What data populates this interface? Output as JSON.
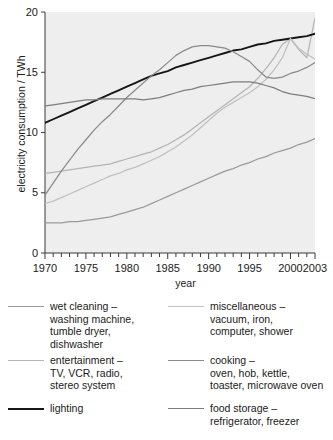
{
  "chart_data": {
    "type": "line",
    "title": "",
    "xlabel": "year",
    "ylabel": "electricity consumption / TWh",
    "xlim": [
      1970,
      2003
    ],
    "ylim": [
      0,
      20
    ],
    "xticks": [
      1970,
      1975,
      1980,
      1985,
      1990,
      1995,
      2000,
      2003
    ],
    "xtick_labels": [
      "1970",
      "1975",
      "1980",
      "1985",
      "1990",
      "1995",
      "2000",
      "2003"
    ],
    "minor_xticks_every": 1,
    "yticks": [
      0,
      5,
      10,
      15,
      20
    ],
    "ytick_labels": [
      "0",
      "5",
      "10",
      "15",
      "20"
    ],
    "grid": false,
    "legend_position": "below",
    "plot_background": "#eeeeee",
    "x": [
      1970,
      1971,
      1972,
      1973,
      1974,
      1975,
      1976,
      1977,
      1978,
      1979,
      1980,
      1981,
      1982,
      1983,
      1984,
      1985,
      1986,
      1987,
      1988,
      1989,
      1990,
      1991,
      1992,
      1993,
      1994,
      1995,
      1996,
      1997,
      1998,
      1999,
      2000,
      2001,
      2002,
      2003
    ],
    "series": [
      {
        "name": "wet cleaning",
        "color": "#9a9a9a",
        "values": [
          2.5,
          2.5,
          2.5,
          2.6,
          2.6,
          2.7,
          2.8,
          2.9,
          3.0,
          3.2,
          3.4,
          3.6,
          3.8,
          4.1,
          4.4,
          4.7,
          5.0,
          5.3,
          5.6,
          5.9,
          6.2,
          6.5,
          6.8,
          7.0,
          7.3,
          7.5,
          7.8,
          8.0,
          8.3,
          8.5,
          8.7,
          9.0,
          9.2,
          9.5
        ]
      },
      {
        "name": "entertainment",
        "color": "#b4b4b4",
        "values": [
          6.6,
          6.7,
          6.8,
          6.9,
          7.0,
          7.1,
          7.2,
          7.3,
          7.4,
          7.6,
          7.8,
          8.0,
          8.2,
          8.4,
          8.7,
          9.0,
          9.4,
          9.8,
          10.3,
          10.8,
          11.3,
          11.8,
          12.3,
          12.8,
          13.3,
          13.8,
          14.5,
          15.3,
          16.2,
          17.3,
          17.8,
          16.9,
          16.2,
          19.5
        ]
      },
      {
        "name": "lighting",
        "color": "#161616",
        "values": [
          10.8,
          11.1,
          11.4,
          11.7,
          12.0,
          12.3,
          12.6,
          12.9,
          13.2,
          13.5,
          13.8,
          14.1,
          14.4,
          14.7,
          14.9,
          15.1,
          15.4,
          15.6,
          15.8,
          16.0,
          16.2,
          16.4,
          16.6,
          16.8,
          16.9,
          17.1,
          17.3,
          17.4,
          17.6,
          17.7,
          17.8,
          17.9,
          18.0,
          18.2
        ]
      },
      {
        "name": "miscellaneous",
        "color": "#c0c0c0",
        "values": [
          4.1,
          4.3,
          4.6,
          4.9,
          5.2,
          5.5,
          5.8,
          6.1,
          6.4,
          6.6,
          6.9,
          7.1,
          7.4,
          7.7,
          8.0,
          8.4,
          8.8,
          9.3,
          9.8,
          10.4,
          11.0,
          11.6,
          12.1,
          12.5,
          12.9,
          13.3,
          13.8,
          14.4,
          15.2,
          16.2,
          17.8,
          17.0,
          16.5,
          16.1
        ]
      },
      {
        "name": "cooking",
        "color": "#8a8a8a",
        "values": [
          4.8,
          5.8,
          6.8,
          7.7,
          8.6,
          9.4,
          10.2,
          10.9,
          11.5,
          12.2,
          12.9,
          13.5,
          14.1,
          14.7,
          15.2,
          15.8,
          16.4,
          16.8,
          17.1,
          17.2,
          17.2,
          17.1,
          17.0,
          16.7,
          16.3,
          15.9,
          15.2,
          14.6,
          14.5,
          14.6,
          14.9,
          15.1,
          15.4,
          15.8
        ]
      },
      {
        "name": "food storage",
        "color": "#7d7d7d",
        "values": [
          12.2,
          12.3,
          12.4,
          12.5,
          12.6,
          12.7,
          12.7,
          12.8,
          12.8,
          12.8,
          12.8,
          12.8,
          12.7,
          12.8,
          12.9,
          13.1,
          13.3,
          13.5,
          13.6,
          13.8,
          13.9,
          14.0,
          14.1,
          14.2,
          14.2,
          14.2,
          14.1,
          13.9,
          13.7,
          13.4,
          13.2,
          13.1,
          13.0,
          12.8
        ]
      }
    ]
  },
  "legend": {
    "left": [
      {
        "key": "wet-cleaning",
        "color": "#9a9a9a",
        "text": "wet cleaning –\nwashing machine,\ntumble dryer,\ndishwasher"
      },
      {
        "key": "entertainment",
        "color": "#b4b4b4",
        "text": "entertainment –\nTV, VCR, radio,\nstereo system"
      },
      {
        "key": "lighting",
        "color": "#161616",
        "text": "lighting"
      }
    ],
    "right": [
      {
        "key": "miscellaneous",
        "color": "#c0c0c0",
        "text": "miscellaneous –\nvacuum, iron,\ncomputer, shower"
      },
      {
        "key": "cooking",
        "color": "#8a8a8a",
        "text": "cooking –\noven, hob, kettle,\ntoaster, microwave oven"
      },
      {
        "key": "food-storage",
        "color": "#7d7d7d",
        "text": "food storage –\nrefrigerator, freezer"
      }
    ]
  }
}
